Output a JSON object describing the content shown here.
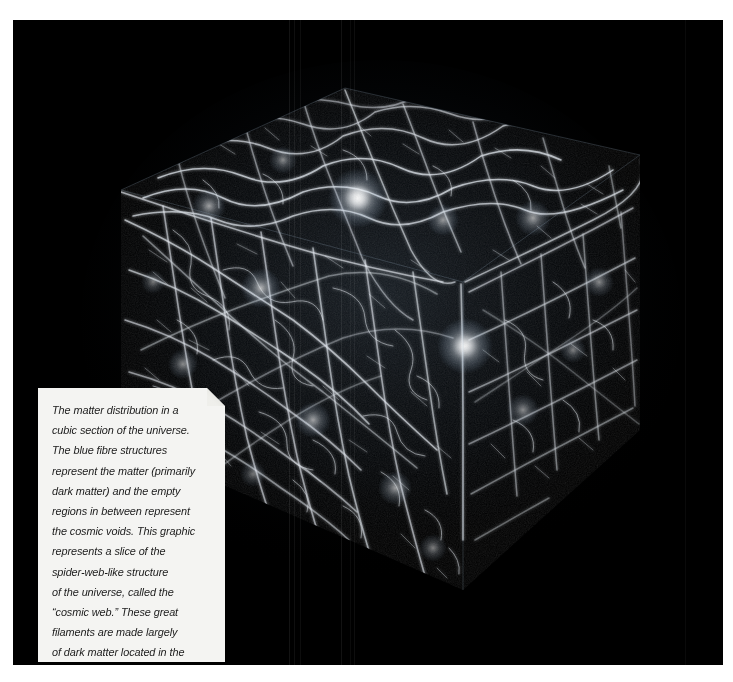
{
  "figure": {
    "kind": "astronomical-simulation-render",
    "background_color": "#000000",
    "plate_border_color": "#ffffff",
    "filament_color": "#ffffff",
    "filament_tint": "#cfe2f5",
    "void_color": "#000000"
  },
  "caption": {
    "panel_background": "#f4f4f2",
    "text_color": "#1b1b1b",
    "text": "The matter distribution in a\ncubic section of the universe.\nThe blue fibre structures\nrepresent the matter (primarily\ndark matter) and the empty\nregions in between represent\nthe cosmic voids. This graphic\nrepresents a slice of the\nspider-web-like structure\nof the universe, called the\n“cosmic web.” These great\nfilaments are made largely\nof dark matter located in the\nspace between galaxies.",
    "lines": [
      "The matter distribution in a",
      "cubic section of the universe.",
      "The blue fibre structures",
      "represent the matter (primarily",
      "dark matter) and the empty",
      "regions in between represent",
      "the cosmic voids. This graphic",
      "represents a slice of the",
      "spider-web-like structure",
      "of the universe, called the",
      "“cosmic web.” These great",
      "filaments are made largely",
      "of dark matter located in the",
      "space between galaxies."
    ]
  }
}
